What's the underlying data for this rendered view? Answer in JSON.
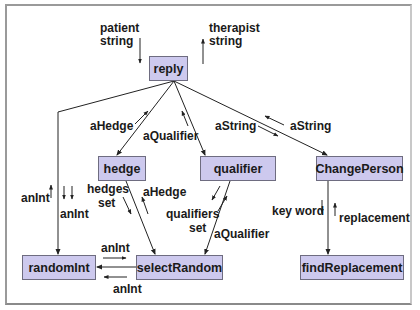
{
  "diagram": {
    "type": "structure-chart",
    "colors": {
      "box_fill": "#cdc9ee",
      "box_border": "#6e6c80",
      "line": "#222222",
      "frame": "#9a9a9a"
    },
    "nodes": {
      "reply": "reply",
      "hedge": "hedge",
      "qualifier": "qualifier",
      "changePerson": "ChangePerson",
      "randomInt": "randomInt",
      "selectRandom": "selectRandom",
      "findReplacement": "findReplacement"
    },
    "labels": {
      "patient_string_1": "patient",
      "patient_string_2": "string",
      "therapist_string_1": "therapist",
      "therapist_string_2": "string",
      "aHedge_up": "aHedge",
      "aQualifier_up": "aQualifier",
      "aString_down": "aString",
      "aString_up": "aString",
      "anInt_up_left": "anInt",
      "anInt_down_left": "anInt",
      "hedges_set_1": "hedges",
      "hedges_set_2": "set",
      "aHedge_sr": "aHedge",
      "qualifiers_set_1": "qualifiers",
      "qualifiers_set_2": "set",
      "aQualifier_sr": "aQualifier",
      "key_word": "key word",
      "replacement": "replacement",
      "anInt_top": "anInt",
      "anInt_bottom": "anInt"
    },
    "edges": [
      {
        "from": "reply",
        "to": "hedge"
      },
      {
        "from": "reply",
        "to": "qualifier"
      },
      {
        "from": "reply",
        "to": "ChangePerson"
      },
      {
        "from": "reply",
        "to": "randomInt"
      },
      {
        "from": "hedge",
        "to": "selectRandom"
      },
      {
        "from": "qualifier",
        "to": "selectRandom"
      },
      {
        "from": "selectRandom",
        "to": "randomInt"
      },
      {
        "from": "ChangePerson",
        "to": "findReplacement"
      }
    ]
  }
}
